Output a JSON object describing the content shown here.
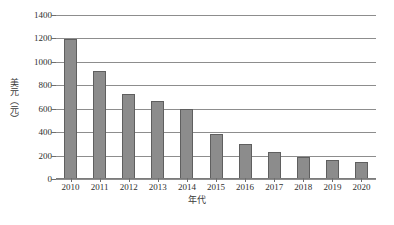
{
  "chart_data": {
    "type": "bar",
    "title": "",
    "xlabel": "年代",
    "ylabel": "美元（元）",
    "categories": [
      "2010",
      "2011",
      "2012",
      "2013",
      "2014",
      "2015",
      "2016",
      "2017",
      "2018",
      "2019",
      "2020"
    ],
    "values": [
      1195,
      925,
      730,
      670,
      600,
      385,
      300,
      228,
      192,
      165,
      148
    ],
    "ylim": [
      0,
      1400
    ],
    "ytick_labels": [
      "1400",
      "1200",
      "1000",
      "800",
      "600",
      "400",
      "200",
      "0"
    ],
    "ytick_values": [
      1400,
      1200,
      1000,
      800,
      600,
      400,
      200,
      0
    ],
    "ystep": 200,
    "grid": true,
    "legend": "none",
    "bar_color": "#8c8c8c",
    "bar_edge_color": "#5f5f5f",
    "gridline_color": "#8d8d8d",
    "background_color": "#ffffff"
  }
}
